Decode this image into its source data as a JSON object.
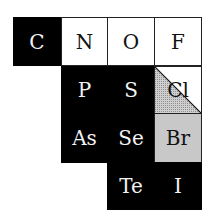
{
  "diagram": {
    "title": "",
    "legend": {
      "black": "black fill",
      "white": "white fill",
      "grey": "grey stippled fill",
      "half": "diagonal split: lower-left grey, upper-right white"
    },
    "cells": [
      {
        "symbol": "C",
        "row": 0,
        "col": 0,
        "fill": "black"
      },
      {
        "symbol": "N",
        "row": 0,
        "col": 1,
        "fill": "white"
      },
      {
        "symbol": "O",
        "row": 0,
        "col": 2,
        "fill": "white"
      },
      {
        "symbol": "F",
        "row": 0,
        "col": 3,
        "fill": "white"
      },
      {
        "symbol": "P",
        "row": 1,
        "col": 1,
        "fill": "black"
      },
      {
        "symbol": "S",
        "row": 1,
        "col": 2,
        "fill": "black"
      },
      {
        "symbol": "Cl",
        "row": 1,
        "col": 3,
        "fill": "half"
      },
      {
        "symbol": "As",
        "row": 2,
        "col": 1,
        "fill": "black"
      },
      {
        "symbol": "Se",
        "row": 2,
        "col": 2,
        "fill": "black"
      },
      {
        "symbol": "Br",
        "row": 2,
        "col": 3,
        "fill": "grey"
      },
      {
        "symbol": "Te",
        "row": 3,
        "col": 2,
        "fill": "black"
      },
      {
        "symbol": "I",
        "row": 3,
        "col": 3,
        "fill": "black"
      }
    ]
  },
  "colors": {
    "black": "#000000",
    "white": "#ffffff",
    "grey": "#c8c8c8",
    "border": "#222222"
  }
}
